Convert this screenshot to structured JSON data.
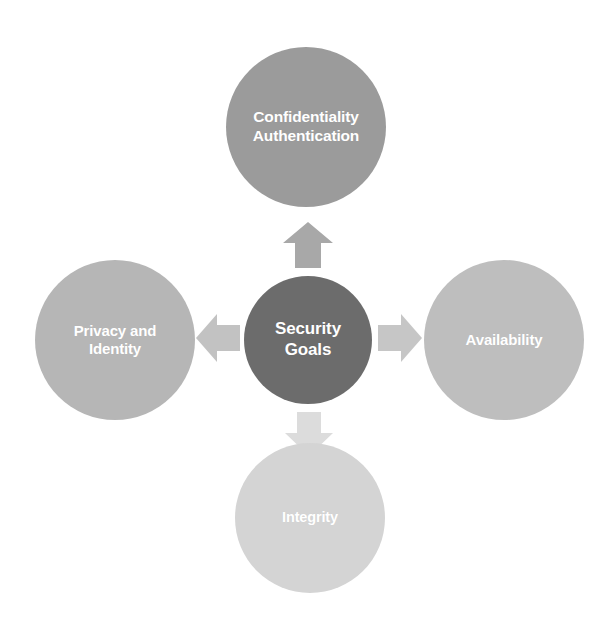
{
  "diagram": {
    "title": "Security Goals",
    "type": "radial-hub-and-spoke",
    "background_color": "#ffffff",
    "center": {
      "id": "security-goals",
      "label_line1": "Security",
      "label_line2": "Goals",
      "color": "#6c6c6c",
      "text_color": "#ffffff",
      "shape": "circle"
    },
    "nodes": [
      {
        "id": "confidentiality-authentication",
        "position": "top",
        "label_line1": "Confidentiality",
        "label_line2": "Authentication",
        "color": "#9b9b9b",
        "text_color": "#ffffff",
        "shape": "circle"
      },
      {
        "id": "privacy-identity",
        "position": "left",
        "label_line1": "Privacy and",
        "label_line2": "Identity",
        "color": "#b6b6b6",
        "text_color": "#ffffff",
        "shape": "circle"
      },
      {
        "id": "availability",
        "position": "right",
        "label_line1": "Availability",
        "label_line2": "",
        "color": "#bebebe",
        "text_color": "#ffffff",
        "shape": "circle"
      },
      {
        "id": "integrity",
        "position": "bottom",
        "label_line1": "Integrity",
        "label_line2": "",
        "color": "#d4d4d4",
        "text_color": "#ffffff",
        "shape": "circle"
      }
    ],
    "arrows": [
      {
        "id": "arrow-up",
        "direction": "up",
        "from": "security-goals",
        "to": "confidentiality-authentication",
        "color": "#a8a8a8"
      },
      {
        "id": "arrow-right",
        "direction": "right",
        "from": "security-goals",
        "to": "availability",
        "color": "#c6c6c6"
      },
      {
        "id": "arrow-down",
        "direction": "down",
        "from": "security-goals",
        "to": "integrity",
        "color": "#dcdcdc"
      },
      {
        "id": "arrow-left",
        "direction": "left",
        "from": "security-goals",
        "to": "privacy-identity",
        "color": "#c2c2c2"
      }
    ]
  }
}
